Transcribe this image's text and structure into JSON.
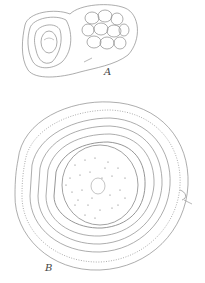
{
  "figure": {
    "panels": [
      {
        "id": "A",
        "label": "A",
        "description": "small cell cluster with encapsulated nucleus and grouped cells"
      },
      {
        "id": "B",
        "label": "B",
        "description": "large concentric layered body with dotted central core"
      }
    ],
    "colors": {
      "ink": "#8a8a8a",
      "dots": "#6e6e6e",
      "background": "#ffffff"
    }
  }
}
